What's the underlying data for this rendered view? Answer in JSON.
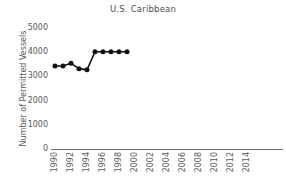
{
  "chart_data": {
    "type": "line",
    "title": "U.S. Caribbean",
    "xlabel": "",
    "ylabel": "Number of Permitted Vessels",
    "x": [
      1990,
      1991,
      1992,
      1993,
      1994,
      1995,
      1996,
      1997,
      1998,
      1999
    ],
    "values": [
      3430,
      3430,
      3540,
      3320,
      3270,
      4020,
      4020,
      4020,
      4020,
      4020
    ],
    "series": [
      {
        "name": "Number of Permitted Vessels",
        "values": [
          3430,
          3430,
          3540,
          3320,
          3270,
          4020,
          4020,
          4020,
          4020,
          4020
        ]
      }
    ],
    "xlim": [
      1989,
      2015
    ],
    "ylim": [
      0,
      5200
    ],
    "xticks": [
      1990,
      1992,
      1994,
      1996,
      1998,
      2000,
      2002,
      2004,
      2006,
      2008,
      2010,
      2012,
      2014
    ],
    "xtick_labels": [
      "1990",
      "1992",
      "1994",
      "1996",
      "1998",
      "2000",
      "2002",
      "2004",
      "2006",
      "2008",
      "2010",
      "2012",
      "2014"
    ],
    "yticks": [
      0,
      1000,
      2000,
      3000,
      4000,
      5000
    ],
    "ytick_labels": [
      "0",
      "1000",
      "2000",
      "3000",
      "4000",
      "5000"
    ],
    "grid": false,
    "legend": false,
    "marker": "circle",
    "line_color": "#111111",
    "marker_color": "#111111",
    "axis_color": "#6e6e6e",
    "text_color": "#595959",
    "title_color": "#4d4d4d",
    "background": "#ffffff"
  }
}
